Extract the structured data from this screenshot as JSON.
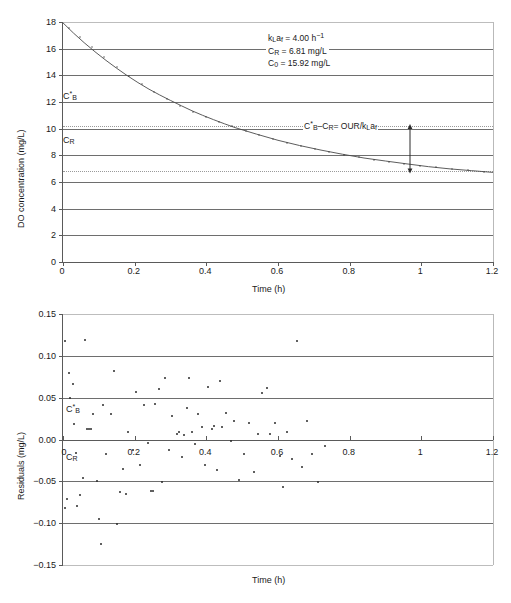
{
  "figure": {
    "background": "#ffffff",
    "line_color": "#4a4a4a",
    "grid_color": "#6e6e6e",
    "point_color": "#2b2b2b"
  },
  "chart_data": [
    {
      "type": "line",
      "id": "do-decay",
      "title": "",
      "xlabel": "Time (h)",
      "ylabel": "DO concentration (mg/L)",
      "xlim": [
        0,
        1.2
      ],
      "ylim": [
        0,
        18
      ],
      "xticks": [
        "0",
        "0.2",
        "0.4",
        "0.6",
        "0.8",
        "1",
        "1.2"
      ],
      "xtick_values": [
        0,
        0.2,
        0.4,
        0.6,
        0.8,
        1,
        1.2
      ],
      "yticks": [
        "0",
        "2",
        "4",
        "6",
        "8",
        "10",
        "12",
        "14",
        "16",
        "18"
      ],
      "ytick_values": [
        0,
        2,
        4,
        6,
        8,
        10,
        12,
        14,
        16,
        18
      ],
      "grid": true,
      "legend": "none",
      "model": "C(t) = C_R + (C_0 - C_R) * exp(-kLa * t)",
      "parameters": {
        "kLa_f": 4.0,
        "kLa_f_units": "h^-1",
        "C_R": 6.81,
        "C_R_units": "mg/L",
        "C_0": 15.92,
        "C_0_units": "mg/L",
        "C_star_B": 10.2
      },
      "series": [
        {
          "name": "DO concentration",
          "x": [
            0,
            0.02,
            0.04,
            0.06,
            0.08,
            0.1,
            0.12,
            0.14,
            0.16,
            0.18,
            0.2,
            0.22,
            0.24,
            0.26,
            0.28,
            0.3,
            0.32,
            0.34,
            0.36,
            0.38,
            0.4,
            0.42,
            0.44,
            0.46,
            0.48,
            0.5,
            0.55,
            0.6,
            0.65,
            0.7,
            0.75,
            0.8,
            0.85,
            0.9,
            0.95,
            0.97
          ],
          "y": [
            15.92,
            15.11,
            14.36,
            13.67,
            13.03,
            12.44,
            11.89,
            11.39,
            10.92,
            10.49,
            10.09,
            9.72,
            9.38,
            9.07,
            8.78,
            8.51,
            8.26,
            8.03,
            7.82,
            7.62,
            7.44,
            7.27,
            7.12,
            6.98,
            6.85,
            6.73,
            6.47,
            6.26,
            6.08,
            5.94,
            5.82,
            5.72,
            5.64,
            5.57,
            5.52,
            5.5
          ]
        }
      ],
      "reference_lines": [
        {
          "name": "C*_B",
          "label": "C*B",
          "value": 10.2,
          "style": "dotted"
        },
        {
          "name": "C_R",
          "label": "CR",
          "value": 6.81,
          "style": "dotted"
        }
      ],
      "annotations": {
        "param_box": {
          "line1_pre": "k",
          "line1": "kLaf = 4.00 h−1",
          "line2": "CR = 6.81 mg/L",
          "line3": "C0 = 15.92 mg/L"
        },
        "difference_label": "C*B–CR= OUR/kLaf",
        "arrow": {
          "x": 0.97,
          "y_top": 10.2,
          "y_bottom": 6.95
        }
      }
    },
    {
      "type": "scatter",
      "id": "residuals",
      "title": "",
      "xlabel": "Time (h)",
      "ylabel": "Residuals (mg/L)",
      "xlim": [
        0,
        1.2
      ],
      "ylim": [
        -0.15,
        0.15
      ],
      "xticks": [
        "0",
        "0.2",
        "0.4",
        "0.6",
        "0.8",
        "1",
        "1.2"
      ],
      "xtick_values": [
        0,
        0.2,
        0.4,
        0.6,
        0.8,
        1,
        1.2
      ],
      "yticks": [
        "0.15",
        "0.10",
        "0.05",
        "0.00",
        "−0.05",
        "−0.10",
        "−0.15"
      ],
      "ytick_values": [
        0.15,
        0.1,
        0.05,
        0.0,
        -0.05,
        -0.1,
        -0.15
      ],
      "grid": true,
      "legend": "none",
      "stray_labels": [
        {
          "name": "C*_B",
          "label": "C*B",
          "x": 0.03,
          "y": 0.027
        },
        {
          "name": "C_R",
          "label": "CR",
          "x": 0.025,
          "y": -0.022
        }
      ],
      "points": [
        [
          0.005,
          0.118
        ],
        [
          0.005,
          -0.082
        ],
        [
          0.012,
          -0.071
        ],
        [
          0.018,
          0.08
        ],
        [
          0.02,
          0.05
        ],
        [
          0.028,
          0.066
        ],
        [
          0.03,
          0.018
        ],
        [
          0.035,
          -0.016
        ],
        [
          0.04,
          -0.079
        ],
        [
          0.048,
          -0.066
        ],
        [
          0.055,
          -0.046
        ],
        [
          0.062,
          0.119
        ],
        [
          0.068,
          0.013
        ],
        [
          0.072,
          0.012
        ],
        [
          0.078,
          0.013
        ],
        [
          0.085,
          0.031
        ],
        [
          0.095,
          -0.05
        ],
        [
          0.1,
          -0.095
        ],
        [
          0.105,
          -0.125
        ],
        [
          0.112,
          0.041
        ],
        [
          0.12,
          -0.017
        ],
        [
          0.135,
          0.03
        ],
        [
          0.142,
          0.082
        ],
        [
          0.15,
          -0.101
        ],
        [
          0.158,
          -0.063
        ],
        [
          0.168,
          -0.035
        ],
        [
          0.175,
          -0.065
        ],
        [
          0.182,
          0.009
        ],
        [
          0.195,
          -0.013
        ],
        [
          0.205,
          0.057
        ],
        [
          0.215,
          -0.03
        ],
        [
          0.225,
          0.041
        ],
        [
          0.238,
          -0.004
        ],
        [
          0.245,
          -0.062
        ],
        [
          0.252,
          -0.062
        ],
        [
          0.258,
          0.042
        ],
        [
          0.268,
          0.06
        ],
        [
          0.275,
          -0.051
        ],
        [
          0.285,
          0.073
        ],
        [
          0.295,
          -0.012
        ],
        [
          0.305,
          0.028
        ],
        [
          0.318,
          0.007
        ],
        [
          0.325,
          0.009
        ],
        [
          0.332,
          -0.021
        ],
        [
          0.338,
          0.005
        ],
        [
          0.345,
          0.038
        ],
        [
          0.352,
          0.073
        ],
        [
          0.36,
          0.009
        ],
        [
          0.368,
          -0.005
        ],
        [
          0.378,
          0.03
        ],
        [
          0.388,
          0.015
        ],
        [
          0.395,
          -0.03
        ],
        [
          0.405,
          0.063
        ],
        [
          0.415,
          0.013
        ],
        [
          0.422,
          0.016
        ],
        [
          0.43,
          -0.037
        ],
        [
          0.438,
          0.07
        ],
        [
          0.445,
          0.015
        ],
        [
          0.455,
          0.032
        ],
        [
          0.468,
          -0.002
        ],
        [
          0.478,
          0.022
        ],
        [
          0.492,
          -0.049
        ],
        [
          0.505,
          -0.017
        ],
        [
          0.518,
          0.02
        ],
        [
          0.532,
          -0.039
        ],
        [
          0.545,
          0.007
        ],
        [
          0.555,
          0.055
        ],
        [
          0.568,
          0.062
        ],
        [
          0.578,
          0.007
        ],
        [
          0.592,
          0.02
        ],
        [
          0.605,
          -0.02
        ],
        [
          0.615,
          -0.057
        ],
        [
          0.625,
          0.009
        ],
        [
          0.638,
          -0.023
        ],
        [
          0.652,
          0.118
        ],
        [
          0.668,
          -0.033
        ],
        [
          0.682,
          0.022
        ],
        [
          0.695,
          -0.017
        ],
        [
          0.712,
          -0.051
        ],
        [
          0.73,
          -0.008
        ]
      ]
    }
  ]
}
